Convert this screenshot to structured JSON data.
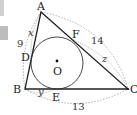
{
  "diagram": {
    "type": "geometry-incircle-triangle",
    "vertices": [
      {
        "name": "A",
        "x": 41,
        "y": 12
      },
      {
        "name": "B",
        "x": 25,
        "y": 89
      },
      {
        "name": "C",
        "x": 128,
        "y": 89
      }
    ],
    "tangent_points": [
      {
        "name": "D",
        "x": 31,
        "y": 58
      },
      {
        "name": "F",
        "x": 71,
        "y": 39
      },
      {
        "name": "E",
        "x": 56,
        "y": 89
      }
    ],
    "center": {
      "name": "O",
      "x": 57,
      "y": 63,
      "radius": 26
    },
    "labels": {
      "A": "A",
      "B": "B",
      "C": "C",
      "D": "D",
      "E": "E",
      "F": "F",
      "O": "O"
    },
    "segment_labels": {
      "AD": "x",
      "BE": "y",
      "FC": "z"
    },
    "side_lengths": {
      "AB": "9",
      "AC": "14",
      "BC": "13"
    },
    "colors": {
      "line": "#222222",
      "dotted": "#9a9a9a",
      "background": "#ffffff"
    }
  }
}
